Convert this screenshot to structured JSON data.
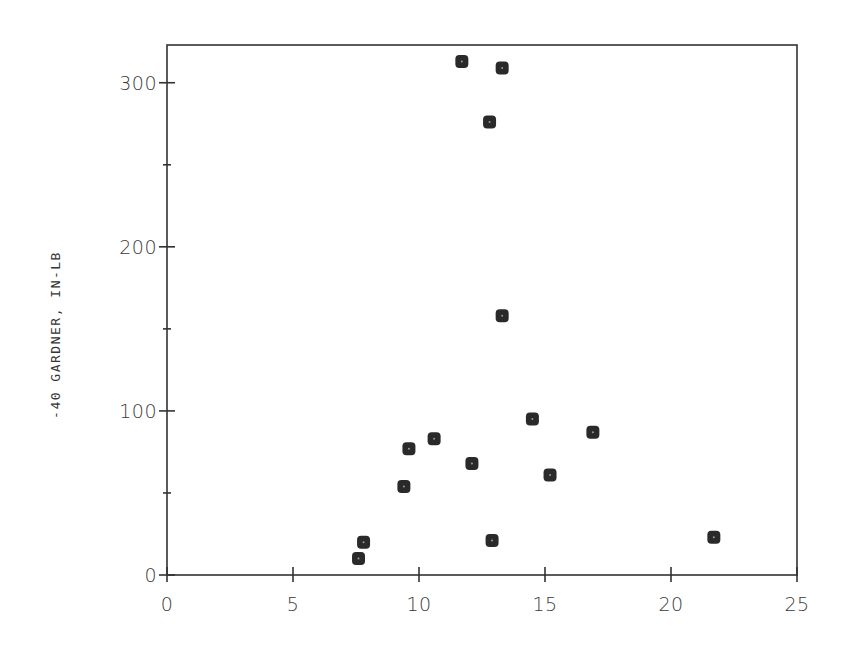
{
  "chart_data": {
    "type": "scatter",
    "title": "",
    "xlabel": "",
    "ylabel": "-40 GARDNER, IN-LB",
    "xlim": [
      0,
      25
    ],
    "ylim": [
      0,
      323
    ],
    "grid": false,
    "legend": null,
    "x_ticks": [
      0,
      5,
      10,
      15,
      20,
      25
    ],
    "x_tick_labels": [
      "0",
      "5",
      "10",
      "15",
      "20",
      "25"
    ],
    "y_ticks": [
      0,
      100,
      200,
      300
    ],
    "y_tick_labels": [
      "0",
      "100",
      "200",
      "300"
    ],
    "y_minor_ticks": [
      50,
      150,
      250
    ],
    "marker": {
      "shape": "rounded-square",
      "color": "#2a2a2a"
    },
    "series": [
      {
        "name": "data",
        "points": [
          {
            "x": 7.6,
            "y": 10
          },
          {
            "x": 7.8,
            "y": 20
          },
          {
            "x": 9.4,
            "y": 54
          },
          {
            "x": 9.6,
            "y": 77
          },
          {
            "x": 10.6,
            "y": 83
          },
          {
            "x": 11.7,
            "y": 313
          },
          {
            "x": 12.1,
            "y": 68
          },
          {
            "x": 12.8,
            "y": 276
          },
          {
            "x": 12.9,
            "y": 21
          },
          {
            "x": 13.3,
            "y": 309
          },
          {
            "x": 13.3,
            "y": 158
          },
          {
            "x": 14.5,
            "y": 95
          },
          {
            "x": 15.2,
            "y": 61
          },
          {
            "x": 16.9,
            "y": 87
          },
          {
            "x": 21.7,
            "y": 23
          }
        ]
      }
    ]
  },
  "layout": {
    "plot_left": 167,
    "plot_right": 797,
    "plot_top": 45,
    "plot_bottom": 575
  }
}
